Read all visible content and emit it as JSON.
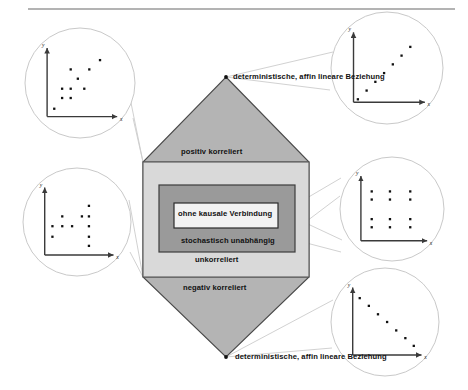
{
  "figure": {
    "title_rule": true,
    "background": "#ffffff",
    "colors": {
      "hex_fill": "#b4b4b4",
      "hex_stroke": "#4a4a4a",
      "outer_rect_fill": "#d9d9d9",
      "outer_rect_stroke": "#5a5a5a",
      "mid_rect_fill": "#9a9a9a",
      "mid_rect_stroke": "#3c3c3c",
      "inner_rect_fill": "#f2f2f2",
      "inner_rect_stroke": "#2b2b2b",
      "circle_stroke": "#c9c9c9",
      "leader_stroke": "#cccccc",
      "axis_stroke": "#3a3a3a",
      "point_fill": "#111111",
      "text": "#111111",
      "rule": "#9a9a9a"
    }
  },
  "hexagon": {
    "top_band_label": "positiv korreliert",
    "middle_band_label": "unkorreliert",
    "bottom_band_label": "negativ korreliert",
    "apex_top_label": "deterministische, affin lineare Beziehung",
    "apex_bottom_label": "deterministische, affin lineare Beziehung"
  },
  "nested_boxes": {
    "middle_label": "stochastisch unabhängig",
    "inner_label": "ohne kausale Verbindung"
  },
  "axis_labels": {
    "x": "x",
    "y": "y"
  },
  "chart_data": [
    {
      "id": "top-left",
      "type": "scatter",
      "title": "",
      "name": "positiv korreliert",
      "xlabel": "x",
      "ylabel": "y",
      "xlim": [
        0,
        10
      ],
      "ylim": [
        0,
        10
      ],
      "grid": false,
      "legend": "none",
      "points": [
        [
          1.0,
          1.1
        ],
        [
          2.1,
          2.6
        ],
        [
          3.3,
          2.6
        ],
        [
          2.1,
          3.9
        ],
        [
          3.3,
          3.9
        ],
        [
          5.2,
          3.9
        ],
        [
          4.3,
          5.3
        ],
        [
          3.3,
          6.6
        ],
        [
          5.9,
          6.6
        ],
        [
          7.4,
          7.9
        ]
      ]
    },
    {
      "id": "top-right",
      "type": "scatter",
      "title": "",
      "name": "deterministische, affin lineare Beziehung (positiv)",
      "xlabel": "x",
      "ylabel": "y",
      "xlim": [
        0,
        10
      ],
      "ylim": [
        0,
        10
      ],
      "grid": false,
      "legend": "none",
      "points": [
        [
          0.6,
          0.4
        ],
        [
          1.8,
          1.6
        ],
        [
          3.0,
          2.8
        ],
        [
          4.2,
          4.0
        ],
        [
          5.4,
          5.2
        ],
        [
          6.6,
          6.4
        ],
        [
          7.8,
          7.6
        ]
      ]
    },
    {
      "id": "middle-left",
      "type": "scatter",
      "title": "",
      "name": "unkorreliert",
      "xlabel": "x",
      "ylabel": "y",
      "xlim": [
        0,
        10
      ],
      "ylim": [
        0,
        10
      ],
      "grid": false,
      "legend": "none",
      "points": [
        [
          1.1,
          2.6
        ],
        [
          1.1,
          4.1
        ],
        [
          2.5,
          4.1
        ],
        [
          3.9,
          4.1
        ],
        [
          2.5,
          5.5
        ],
        [
          5.3,
          5.5
        ],
        [
          6.3,
          7.0
        ],
        [
          6.3,
          5.5
        ],
        [
          6.3,
          4.1
        ],
        [
          6.3,
          2.6
        ],
        [
          6.3,
          1.3
        ]
      ]
    },
    {
      "id": "middle-right",
      "type": "scatter",
      "title": "",
      "name": "stochastisch unabhängig (Gitter)",
      "xlabel": "x",
      "ylabel": "y",
      "xlim": [
        0,
        10
      ],
      "ylim": [
        0,
        10
      ],
      "grid": false,
      "legend": "none",
      "points": [
        [
          1.6,
          2.0
        ],
        [
          4.3,
          2.0
        ],
        [
          7.3,
          2.0
        ],
        [
          1.6,
          3.2
        ],
        [
          4.3,
          3.2
        ],
        [
          7.3,
          3.2
        ],
        [
          1.6,
          6.1
        ],
        [
          4.3,
          6.1
        ],
        [
          7.3,
          6.1
        ],
        [
          1.6,
          7.3
        ],
        [
          4.3,
          7.3
        ],
        [
          7.3,
          7.3
        ]
      ]
    },
    {
      "id": "bottom-right",
      "type": "scatter",
      "title": "",
      "name": "deterministische, affin lineare Beziehung (negativ)",
      "xlabel": "x",
      "ylabel": "y",
      "xlim": [
        0,
        10
      ],
      "ylim": [
        0,
        10
      ],
      "grid": false,
      "legend": "none",
      "points": [
        [
          1.0,
          8.1
        ],
        [
          2.3,
          7.0
        ],
        [
          3.6,
          5.8
        ],
        [
          4.9,
          4.7
        ],
        [
          6.2,
          3.5
        ],
        [
          7.5,
          2.4
        ],
        [
          8.7,
          1.3
        ]
      ]
    }
  ]
}
